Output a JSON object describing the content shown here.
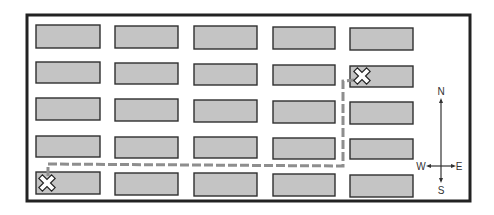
{
  "map": {
    "description": "Street grid map with route between two locations",
    "grid": {
      "rows": 5,
      "columns": 5
    },
    "colors": {
      "block_fill": "#c4c4c4",
      "block_stroke": "#2f2f2f",
      "route": "#8e8e8e",
      "frame": "#222222"
    },
    "markers": [
      {
        "name": "start",
        "icon": "x-marker-icon",
        "row": 5,
        "column": 1
      },
      {
        "name": "destination",
        "icon": "x-marker-icon",
        "row": 2,
        "column": 5
      }
    ],
    "route": {
      "style": "dashed",
      "directions": [
        "north",
        "east",
        "north",
        "east"
      ]
    }
  },
  "compass": {
    "north": "N",
    "south": "S",
    "east": "E",
    "west": "W"
  }
}
